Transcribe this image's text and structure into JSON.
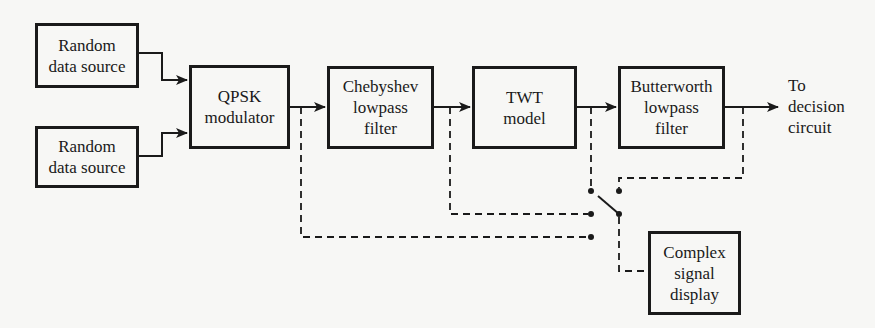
{
  "diagram": {
    "type": "block-diagram",
    "blocks": [
      {
        "id": "src1",
        "lines": [
          "Random",
          "data source"
        ]
      },
      {
        "id": "src2",
        "lines": [
          "Random",
          "data source"
        ]
      },
      {
        "id": "qpsk",
        "lines": [
          "QPSK",
          "modulator"
        ]
      },
      {
        "id": "cheb",
        "lines": [
          "Chebyshev",
          "lowpass",
          "filter"
        ]
      },
      {
        "id": "twt",
        "lines": [
          "TWT",
          "model"
        ]
      },
      {
        "id": "butter",
        "lines": [
          "Butterworth",
          "lowpass",
          "filter"
        ]
      },
      {
        "id": "display",
        "lines": [
          "Complex",
          "signal",
          "display"
        ]
      }
    ],
    "output_label": [
      "To",
      "decision",
      "circuit"
    ],
    "connections": [
      {
        "from": "src1",
        "to": "qpsk",
        "style": "solid"
      },
      {
        "from": "src2",
        "to": "qpsk",
        "style": "solid"
      },
      {
        "from": "qpsk",
        "to": "cheb",
        "style": "solid"
      },
      {
        "from": "cheb",
        "to": "twt",
        "style": "solid"
      },
      {
        "from": "twt",
        "to": "butter",
        "style": "solid"
      },
      {
        "from": "butter",
        "to": "output",
        "style": "solid"
      },
      {
        "from": "qpsk-output-tap",
        "to": "switch",
        "style": "dashed"
      },
      {
        "from": "cheb-output-tap",
        "to": "switch",
        "style": "dashed"
      },
      {
        "from": "twt-output-tap",
        "to": "switch",
        "style": "dashed"
      },
      {
        "from": "butter-output-tap",
        "to": "switch",
        "style": "dashed"
      },
      {
        "from": "switch",
        "to": "display",
        "style": "dashed"
      }
    ],
    "switch": {
      "positions": 4
    }
  }
}
